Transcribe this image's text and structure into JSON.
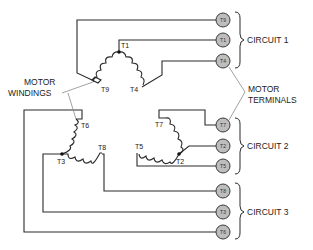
{
  "diagram": {
    "type": "nine-lead wye-connected motor wiring diagram",
    "labels": {
      "motor_windings_line1": "MOTOR",
      "motor_windings_line2": "WINDINGS",
      "motor_terminals_line1": "MOTOR",
      "motor_terminals_line2": "TERMINALS"
    },
    "circuits": [
      {
        "label": "CIRCUIT 1",
        "terminals": [
          "T9",
          "T1",
          "T4"
        ]
      },
      {
        "label": "CIRCUIT 2",
        "terminals": [
          "T7",
          "T2",
          "T5"
        ]
      },
      {
        "label": "CIRCUIT 3",
        "terminals": [
          "T8",
          "T3",
          "T6"
        ]
      }
    ],
    "windings": [
      {
        "name": "winding-1",
        "leads": [
          "T1",
          "T9",
          "T4"
        ],
        "labels": {
          "a": "T1",
          "b": "T9",
          "c": "T4"
        }
      },
      {
        "name": "winding-2",
        "leads": [
          "T7",
          "T2",
          "T5"
        ],
        "labels": {
          "a": "T7",
          "b": "T2",
          "c": "T5"
        }
      },
      {
        "name": "winding-3",
        "leads": [
          "T6",
          "T3",
          "T8"
        ],
        "labels": {
          "a": "T6",
          "b": "T3",
          "c": "T8"
        }
      }
    ],
    "colors": {
      "wire": "#2a2a2a",
      "terminal_fill": "#bdbdbd",
      "leader": "#8a8a8a"
    }
  }
}
